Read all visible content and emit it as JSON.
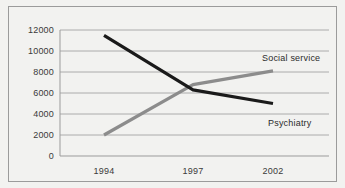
{
  "chart_data": {
    "type": "line",
    "title": "",
    "subtitle": "",
    "xlabel": "",
    "ylabel": "",
    "categories": [
      "1994",
      "1997",
      "2002"
    ],
    "x": [
      1994,
      1997,
      2002
    ],
    "series": [
      {
        "name": "Psychiatry",
        "color": "#1a1a1a",
        "values": [
          11500,
          6300,
          5000
        ]
      },
      {
        "name": "Social service",
        "color": "#8c8c8c",
        "values": [
          2000,
          6800,
          8100
        ]
      }
    ],
    "ylim": [
      0,
      12000
    ],
    "yticks": [
      0,
      2000,
      4000,
      6000,
      8000,
      10000,
      12000
    ],
    "ytick_labels": [
      "0",
      "2000",
      "4000",
      "6000",
      "8000",
      "10000",
      "12000"
    ],
    "xtick_labels": [
      "1994",
      "1997",
      "2002"
    ],
    "grid": true,
    "grid_axis": "y",
    "grid_color": "#9b9b9b",
    "legend": "inline-labels",
    "legend_position": "right",
    "annotations": [
      {
        "text": "Social service",
        "near_series": "Social service"
      },
      {
        "text": "Psychiatry",
        "near_series": "Psychiatry"
      }
    ],
    "background_color": "#f2f2f0",
    "border_color": "#9b9b9b"
  },
  "figure": {
    "outer_border_color": "#9b9b9b",
    "plot_background": "#f2f2f0"
  }
}
